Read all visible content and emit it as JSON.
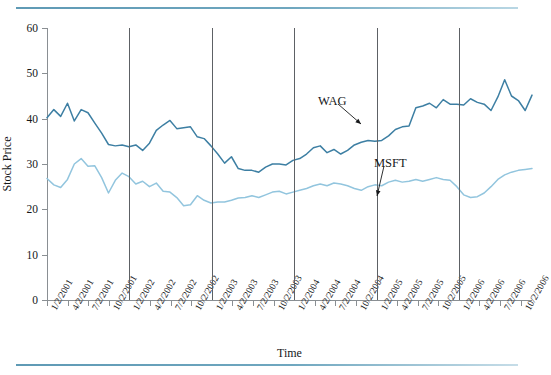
{
  "figure": {
    "title_fragment": "",
    "xlabel": "Time",
    "ylabel": "Stock Price"
  },
  "annotations": [
    {
      "name": "wag",
      "label": "WAG",
      "x": 318,
      "y": 94,
      "tip_x": 361,
      "tip_y": 124,
      "from_x": 338,
      "from_y": 104
    },
    {
      "name": "msft",
      "label": "MSFT",
      "x": 374,
      "y": 156,
      "tip_x": 377,
      "tip_y": 196,
      "from_x": 384,
      "from_y": 166
    }
  ],
  "colors": {
    "wag_line": "#3d7fa3",
    "msft_line": "#92c5de",
    "axis": "#8a8f93",
    "gridline": "#5d6165",
    "rule": "#6fa7bf",
    "text": "#16181a",
    "background": "#ffffff"
  },
  "chart_data": {
    "type": "line",
    "title": "",
    "xlabel": "Time",
    "ylabel": "Stock Price",
    "ylim": [
      0,
      60
    ],
    "yticks": [
      0,
      10,
      20,
      30,
      40,
      50,
      60
    ],
    "grid": "vertical gridlines at January of each year (1/2/2002, 1/2/2003, 1/2/2004, 1/2/2005, 1/2/2006)",
    "legend": "inline annotations with arrows (WAG, MSFT)",
    "xtick_labels": [
      "1/2/2001",
      "4/2/2001",
      "7/2/2001",
      "10/2/2001",
      "1/2/2002",
      "4/2/2002",
      "7/2/2002",
      "10/2/2002",
      "1/2/2003",
      "4/2/2003",
      "7/2/2003",
      "10/2/2003",
      "1/2/2004",
      "4/2/2004",
      "7/2/2004",
      "10/2/2004",
      "1/2/2005",
      "4/2/2005",
      "7/2/2005",
      "10/2/2005",
      "1/2/2006",
      "4/2/2006",
      "7/2/2006",
      "10/2/2006"
    ],
    "gridline_labels": [
      "1/2/2002",
      "1/2/2003",
      "1/2/2004",
      "1/2/2005",
      "1/2/2006"
    ],
    "n_points": 72,
    "x_start": "1/2/2001",
    "x_end": "12/2/2006",
    "x_step": "monthly",
    "series": [
      {
        "name": "WAG",
        "color": "#3d7fa3",
        "values": [
          40.2,
          42.0,
          40.5,
          43.4,
          39.5,
          42.0,
          41.3,
          39.0,
          36.8,
          34.3,
          34.0,
          34.2,
          33.8,
          34.2,
          33.0,
          34.6,
          37.4,
          38.6,
          39.6,
          37.8,
          38.0,
          38.2,
          36.0,
          35.6,
          34.0,
          32.2,
          30.2,
          31.6,
          29.0,
          28.6,
          28.6,
          28.2,
          29.3,
          30.0,
          30.0,
          29.8,
          30.8,
          31.2,
          32.2,
          33.6,
          34.0,
          32.5,
          33.2,
          32.2,
          33.0,
          34.2,
          34.8,
          35.2,
          35.0,
          35.2,
          36.2,
          37.6,
          38.2,
          38.4,
          42.4,
          42.8,
          43.4,
          42.4,
          44.2,
          43.2,
          43.2,
          43.0,
          44.4,
          43.6,
          43.2,
          41.8,
          44.8,
          48.6,
          45.0,
          44.0,
          41.8,
          45.2
        ]
      },
      {
        "name": "MSFT",
        "color": "#92c5de",
        "values": [
          26.8,
          25.4,
          24.8,
          26.6,
          30.0,
          31.2,
          29.5,
          29.6,
          27.0,
          23.6,
          26.4,
          28.0,
          27.2,
          25.6,
          26.2,
          25.0,
          25.8,
          24.0,
          23.8,
          22.6,
          20.8,
          21.0,
          23.0,
          22.0,
          21.4,
          21.6,
          21.6,
          22.0,
          22.5,
          22.6,
          23.0,
          22.6,
          23.2,
          23.8,
          24.0,
          23.4,
          23.8,
          24.2,
          24.6,
          25.2,
          25.6,
          25.2,
          25.8,
          25.6,
          25.2,
          24.6,
          24.2,
          25.0,
          25.4,
          25.2,
          26.0,
          26.4,
          26.0,
          26.2,
          26.6,
          26.2,
          26.6,
          27.0,
          26.6,
          26.4,
          25.0,
          23.2,
          22.6,
          22.8,
          23.6,
          25.0,
          26.6,
          27.6,
          28.2,
          28.6,
          28.8,
          29.0
        ]
      }
    ]
  }
}
